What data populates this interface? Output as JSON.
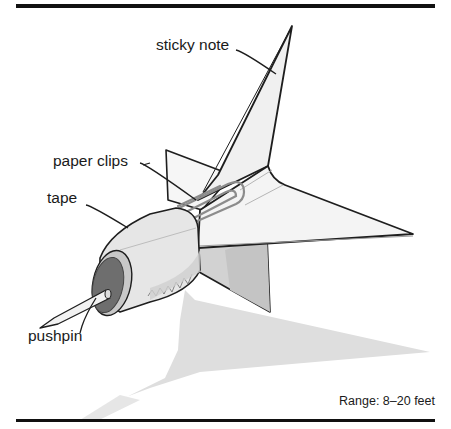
{
  "figure": {
    "type": "labeled-illustration",
    "labels": {
      "sticky_note": "sticky note",
      "paper_clips": "paper clips",
      "tape": "tape",
      "pushpin": "pushpin"
    },
    "caption": "Range: 8–20 feet"
  },
  "colors": {
    "rule": "#111111",
    "outline": "#1e1e1e",
    "fin_fill": "#f1f1f1",
    "fin_shade": "#cfcfcf",
    "shadow": "#dcdcdc",
    "cap": "#6b6b6b",
    "body": "#e4e4e4"
  }
}
